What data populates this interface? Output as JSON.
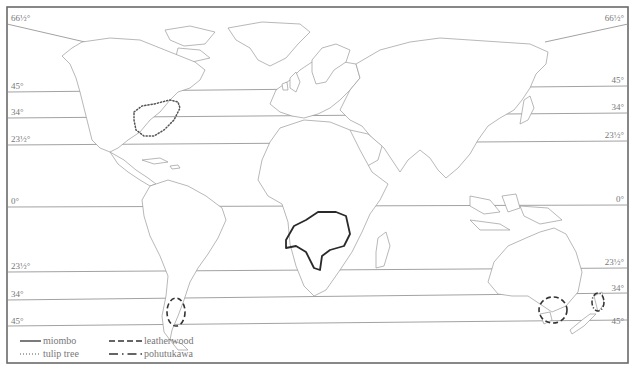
{
  "map": {
    "title": "World distribution of selected tree species",
    "latitude_labels_left": [
      "66½°",
      "45°",
      "34°",
      "23½°",
      "0°",
      "23½°",
      "34°",
      "45°"
    ],
    "latitude_labels_right": [
      "66½°",
      "45°",
      "34°",
      "23½°",
      "0°",
      "23½°",
      "34°",
      "45°"
    ],
    "latitudes": [
      {
        "name": "arctic-circle",
        "label": "66½°"
      },
      {
        "name": "lat-45n",
        "label": "45°"
      },
      {
        "name": "lat-34n",
        "label": "34°"
      },
      {
        "name": "tropic-of-cancer",
        "label": "23½°"
      },
      {
        "name": "equator",
        "label": "0°"
      },
      {
        "name": "tropic-of-capricorn",
        "label": "23½°"
      },
      {
        "name": "lat-34s",
        "label": "34°"
      },
      {
        "name": "lat-45s",
        "label": "45°"
      }
    ],
    "ranges": [
      {
        "species": "miombo",
        "region": "south-central Africa",
        "line_style": "solid"
      },
      {
        "species": "tulip tree",
        "region": "eastern North America",
        "line_style": "dotted"
      },
      {
        "species": "leatherwood",
        "region": "southern Chile and Tasmania",
        "line_style": "dashed"
      },
      {
        "species": "pohutukawa",
        "region": "northern New Zealand",
        "line_style": "dash-dot"
      }
    ]
  },
  "legend": {
    "items": [
      {
        "label": "miombo",
        "style": "solid"
      },
      {
        "label": "tulip tree",
        "style": "dotted"
      },
      {
        "label": "leatherwood",
        "style": "dashed"
      },
      {
        "label": "pohutukawa",
        "style": "dash-dot"
      }
    ]
  }
}
